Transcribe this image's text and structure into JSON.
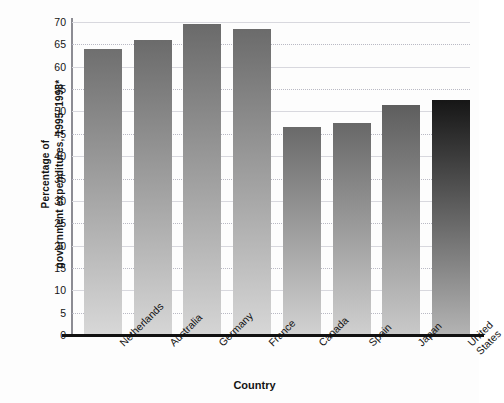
{
  "chart_data": {
    "type": "bar",
    "title": "",
    "subtitle": "",
    "xlabel": "Country",
    "ylabel": "Percentage of government expenditures, 1995–1998*",
    "ylabel_lines": [
      "Percentage of",
      "government expenditures, 1995–1998*"
    ],
    "categories": [
      "Netherlands",
      "Australia",
      "Germany",
      "France",
      "Canada",
      "Spain",
      "Japan",
      "United States"
    ],
    "category_lines": [
      [
        "Netherlands"
      ],
      [
        "Australia"
      ],
      [
        "Germany"
      ],
      [
        "France"
      ],
      [
        "Canada"
      ],
      [
        "Spain"
      ],
      [
        "Japan"
      ],
      [
        "United",
        "States"
      ]
    ],
    "values": [
      64,
      66,
      69.5,
      68.5,
      46.5,
      47.5,
      51.5,
      52.5
    ],
    "ylim": [
      0,
      70
    ],
    "yticks": [
      0,
      5,
      10,
      15,
      20,
      25,
      30,
      35,
      40,
      45,
      50,
      55,
      60,
      65,
      70
    ],
    "ytick_labels": [
      "0",
      "5",
      "10",
      "15",
      "20",
      "25",
      "30",
      "35",
      "40",
      "45",
      "50",
      "55",
      "60",
      "65",
      "70"
    ],
    "grid": true,
    "grid_axis": "y",
    "legend": "none",
    "bar_gradients": [
      {
        "top": "#6f6f6f",
        "bottom": "#d8d8d8"
      },
      {
        "top": "#6b6b6b",
        "bottom": "#d6d6d6"
      },
      {
        "top": "#6a6a6a",
        "bottom": "#d5d5d5"
      },
      {
        "top": "#6b6b6b",
        "bottom": "#d7d7d7"
      },
      {
        "top": "#6a6a6a",
        "bottom": "#d2d2d2"
      },
      {
        "top": "#686868",
        "bottom": "#d0d0d0"
      },
      {
        "top": "#5e5e5e",
        "bottom": "#c9c9c9"
      },
      {
        "top": "#161616",
        "bottom": "#b4b4b4"
      }
    ],
    "colors": {
      "axis": "#111111",
      "gridline": "#b9b9c4",
      "text": "#141414",
      "background": "#fdfdfd"
    }
  }
}
